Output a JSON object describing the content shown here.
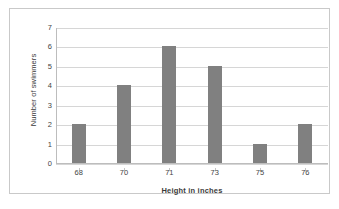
{
  "chart_data": {
    "type": "bar",
    "title": "",
    "xlabel": "Height in inches",
    "ylabel": "Number of swimmers",
    "categories": [
      "68",
      "70",
      "71",
      "73",
      "75",
      "76"
    ],
    "values": [
      2,
      4,
      6,
      5,
      1,
      2
    ],
    "ylim": [
      0,
      7
    ],
    "yticks": [
      "0",
      "1",
      "2",
      "3",
      "4",
      "5",
      "6",
      "7"
    ],
    "grid": true,
    "legend": "none",
    "series_color": "#808080",
    "gridline_color": "#d6d6d6",
    "axis_color": "#bdbdbd",
    "border_color": "#c9c9c9",
    "background": "#ffffff"
  }
}
